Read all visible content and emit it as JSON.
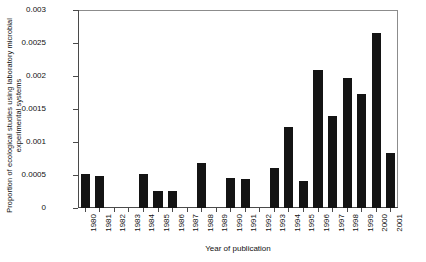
{
  "chart_data": {
    "type": "bar",
    "title": "",
    "xlabel": "Year of publication",
    "ylabel": "Proportion of ecological studies using laboratory microbial experimental systems",
    "categories": [
      "1980",
      "1981",
      "1982",
      "1983",
      "1984",
      "1985",
      "1986",
      "1987",
      "1988",
      "1989",
      "1990",
      "1991",
      "1992",
      "1993",
      "1994",
      "1995",
      "1996",
      "1997",
      "1998",
      "1999",
      "2000",
      "2001"
    ],
    "values": [
      0.00051,
      0.00049,
      0.0,
      0.0,
      0.00051,
      0.00026,
      0.00026,
      0.0,
      0.00068,
      0.0,
      0.00045,
      0.00044,
      0.0,
      0.00061,
      0.00122,
      0.00041,
      0.00209,
      0.0014,
      0.00197,
      0.00172,
      0.00265,
      0.00084
    ],
    "ylim": [
      0,
      0.003
    ],
    "yticks": [
      0,
      0.0005,
      0.001,
      0.0015,
      0.002,
      0.0025,
      0.003
    ],
    "ytick_labels": [
      "0",
      "0.0005",
      "0.001",
      "0.0015",
      "0.002",
      "0.0025",
      "0.003"
    ],
    "grid": false,
    "legend": null,
    "bar_color": "#141414",
    "axis_color": "#4a4a4a"
  }
}
